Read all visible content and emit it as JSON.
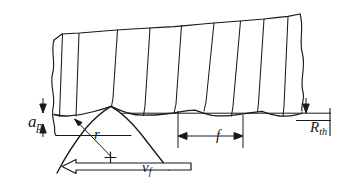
{
  "figure": {
    "name": "turning-surface-roughness-diagram",
    "line_color": "#1a1a1a",
    "background_color": "#ffffff"
  },
  "labels": {
    "depth_of_cut": {
      "symbol": "a",
      "subscript": "p"
    },
    "roughness_height": {
      "symbol": "R",
      "subscript": "th"
    },
    "feed": {
      "symbol": "f",
      "subscript": ""
    },
    "nose_radius": {
      "symbol": "r",
      "subscript": ""
    },
    "feed_velocity": {
      "symbol": "v",
      "subscript": "f"
    }
  },
  "geometry": {
    "workpiece_top_edge": "M 54,40 L 68,34 L 88,33 L 116,30 L 150,28 L 182,26 L 214,23 L 246,20 L 276,17 L 300,14",
    "left_break_edge": "M 54,40 C 51,55 55,70 52,86 C 50,100 56,112 54,126 L 56,135",
    "right_break_edge": "M 300,14 C 304,30 299,46 303,62 C 305,78 300,92 303,104 L 301,112",
    "workpiece_left_bottom": "M 56,135 L 131,135",
    "scallop_profile": "M 54,114 Q 66,116 75,115 Q 96,114 111,106 Q 126,113 141,114 Q 158,115 172,113 Q 186,112 199,111 Q 216,116 229,115 Q 244,114 257,112 Q 272,116 285,115 Q 294,115 302,113",
    "reference_line": "M 122,113 L 330,113",
    "vertical_grooves": [
      "M 62,34 L 59,116",
      "M 78,33 L 75,116",
      "M 117,30 L 111,107",
      "M 150,28 L 143,115",
      "M 181,26 L 174,114",
      "M 214,23 L 203,112",
      "M 240,21 L 231,116",
      "M 264,19 L 258,113",
      "M 288,16 L 287,116"
    ],
    "tool_nose_arc": "M 58,172 Q 80,128 111,106 Q 144,122 170,166",
    "tool_center_mark": {
      "x": 111,
      "y": 158,
      "size": 7
    },
    "radius_leader": "M 111,158 L 75,120",
    "feed_arrow": {
      "x1": 178,
      "x2": 243,
      "y": 136
    },
    "feed_extension_left": "M 178,112 L 178,147",
    "feed_extension_right": "M 243,115 L 243,147",
    "ap_arrow_top": "M 43,99 L 43,112",
    "ap_arrow_bottom": "M 43,137 L 43,124",
    "rth_arrow_top": "M 306,99 L 306,111",
    "rth_line_lower": "M 296,120 L 330,120",
    "rth_tick": "M 330,108 L 330,134",
    "vf_arrow": {
      "outline": "M 63,166 L 76,159 L 76,163 L 191,163 L 191,170 L 76,170 L 76,174 Z"
    }
  }
}
